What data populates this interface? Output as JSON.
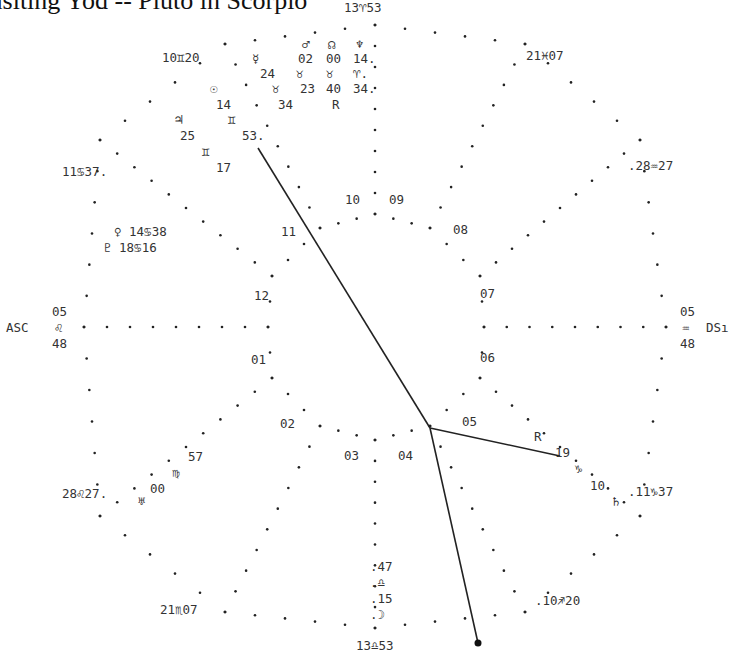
{
  "title": "ansiting Yod -- Pluto in Scorpio",
  "colors": {
    "ink": "#222222",
    "background": "#ffffff"
  },
  "cusps": {
    "mc": "13♈︎53",
    "ic": "13♎︎53",
    "asc_label": "ASC",
    "asc_deg": "05",
    "asc_sign": "♌︎",
    "asc_min": "48",
    "dsc_label": "DSı",
    "dsc_deg": "05",
    "dsc_sign": "♒︎",
    "dsc_min": "48",
    "c11": "10♊︎20",
    "c12": "11♋︎37.",
    "c2": "28♌︎27.",
    "c3": "21♏︎07",
    "c5": ".10♐︎20",
    "c6": ".11♑︎37",
    "c8": ".28♒︎27",
    "c9": "21♓︎07"
  },
  "houses": [
    "01",
    "02",
    "03",
    "04",
    "05",
    "06",
    "07",
    "08",
    "09",
    "10",
    "11",
    "12"
  ],
  "planets": {
    "mars_glyph": "♂︎",
    "mars_deg": "02",
    "mars_sign": "♉︎",
    "mars_min": "23",
    "node_glyph": "☊︎",
    "node_deg": "00",
    "node_sign": "♉︎",
    "node_min": "40",
    "node_retro": "R",
    "neptune_glyph": "♆︎",
    "neptune_deg": "14.",
    "neptune_sign": "♈︎.",
    "neptune_min": "34.",
    "mercury_glyph": "☿︎",
    "mercury_deg": "24",
    "mercury_sign": "♉︎",
    "mercury_min": "34",
    "sun_glyph": "☉︎",
    "sun_deg": "14",
    "jupiter_glyph": "♃︎",
    "jupiter_deg": "25",
    "gemini_glyph": "♊︎",
    "jupiter_min": "53.",
    "gemini2_glyph": "♊︎",
    "sun_min": "17",
    "venus": "♀︎ 14♋︎38",
    "pluto": "♇︎ 18♋︎16",
    "uranus_glyph": "♅︎",
    "uranus_deg": "57",
    "uranus_sign": "♍︎",
    "uranus_min": "00",
    "moon_min": ".47",
    "moon_sign": ".♎︎",
    "moon_deg": ".15",
    "moon_glyph": ".☽︎",
    "saturn_retro": "R",
    "saturn_deg": "19",
    "saturn_sign": "♑︎",
    "saturn_min": "10",
    "saturn_glyph": "♄︎"
  },
  "aspect_lines": [
    {
      "name": "yod-leg-mercury",
      "x1": 258,
      "y1": 148,
      "x2": 430,
      "y2": 428
    },
    {
      "name": "yod-leg-saturn",
      "x1": 430,
      "y1": 428,
      "x2": 560,
      "y2": 456
    },
    {
      "name": "yod-leg-pluto",
      "x1": 430,
      "y1": 428,
      "x2": 478,
      "y2": 643
    }
  ],
  "apex_point": {
    "x": 478,
    "y": 643,
    "r": 3.5
  }
}
